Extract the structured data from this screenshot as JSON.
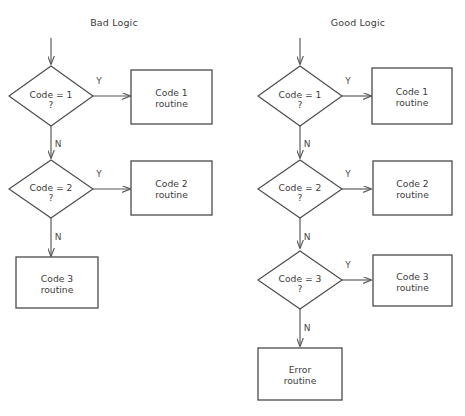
{
  "page": {
    "background": "#ffffff",
    "line_color": "#4a4a4a",
    "text_color": "#3c3c3c",
    "width": 465,
    "height": 416
  },
  "charts": [
    {
      "id": "bad-logic",
      "title": "Bad Logic",
      "title_x": 114,
      "title_y": 26,
      "entry_arrow": {
        "x": 51,
        "y1": 38,
        "y2": 64
      },
      "rows": [
        {
          "decision": {
            "name": "decision-code-1",
            "line1": "Code = 1",
            "line2": "?",
            "cx": 51,
            "cy": 96,
            "rx": 42,
            "ry": 30
          },
          "yes": {
            "label": "Y",
            "label_x": 99,
            "label_y": 84,
            "from_x": 93,
            "to_x": 130,
            "y": 96
          },
          "no": {
            "label": "N",
            "label_x": 58,
            "label_y": 147,
            "x": 51,
            "from_y": 126,
            "to_y": 158
          },
          "box": {
            "name": "box-code-1-routine",
            "line1": "Code 1",
            "line2": "routine",
            "x": 131,
            "y": 70,
            "w": 81,
            "h": 54
          }
        },
        {
          "decision": {
            "name": "decision-code-2",
            "line1": "Code = 2",
            "line2": "?",
            "cx": 51,
            "cy": 189,
            "rx": 42,
            "ry": 29
          },
          "yes": {
            "label": "Y",
            "label_x": 99,
            "label_y": 177,
            "from_x": 93,
            "to_x": 130,
            "y": 189
          },
          "no": {
            "label": "N",
            "label_x": 58,
            "label_y": 240,
            "x": 51,
            "from_y": 218,
            "to_y": 256
          },
          "box": {
            "name": "box-code-2-routine",
            "line1": "Code 2",
            "line2": "routine",
            "x": 131,
            "y": 161,
            "w": 81,
            "h": 54
          }
        }
      ],
      "terminal_box": {
        "name": "box-code-3-routine",
        "line1": "Code 3",
        "line2": "routine",
        "x": 16,
        "y": 257,
        "w": 82,
        "h": 51
      }
    },
    {
      "id": "good-logic",
      "title": "Good Logic",
      "title_x": 358,
      "title_y": 26,
      "entry_arrow": {
        "x": 300,
        "y1": 38,
        "y2": 64
      },
      "rows": [
        {
          "decision": {
            "name": "decision-code-1",
            "line1": "Code = 1",
            "line2": "?",
            "cx": 300,
            "cy": 96,
            "rx": 42,
            "ry": 30
          },
          "yes": {
            "label": "Y",
            "label_x": 348,
            "label_y": 84,
            "from_x": 342,
            "to_x": 371,
            "y": 96
          },
          "no": {
            "label": "N",
            "label_x": 307,
            "label_y": 147,
            "x": 300,
            "from_y": 126,
            "to_y": 158
          },
          "box": {
            "name": "box-code-1-routine",
            "line1": "Code 1",
            "line2": "routine",
            "x": 372,
            "y": 68,
            "w": 80,
            "h": 56
          }
        },
        {
          "decision": {
            "name": "decision-code-2",
            "line1": "Code = 2",
            "line2": "?",
            "cx": 300,
            "cy": 189,
            "rx": 42,
            "ry": 29
          },
          "yes": {
            "label": "Y",
            "label_x": 348,
            "label_y": 177,
            "from_x": 342,
            "to_x": 371,
            "y": 189
          },
          "no": {
            "label": "N",
            "label_x": 307,
            "label_y": 240,
            "x": 300,
            "from_y": 218,
            "to_y": 248
          },
          "box": {
            "name": "box-code-2-routine",
            "line1": "Code 2",
            "line2": "routine",
            "x": 373,
            "y": 161,
            "w": 79,
            "h": 54
          }
        },
        {
          "decision": {
            "name": "decision-code-3",
            "line1": "Code = 3",
            "line2": "?",
            "cx": 300,
            "cy": 280,
            "rx": 42,
            "ry": 29
          },
          "yes": {
            "label": "Y",
            "label_x": 348,
            "label_y": 268,
            "from_x": 342,
            "to_x": 371,
            "y": 280
          },
          "no": {
            "label": "N",
            "label_x": 307,
            "label_y": 331,
            "x": 300,
            "from_y": 309,
            "to_y": 346
          },
          "box": {
            "name": "box-code-3-routine",
            "line1": "Code 3",
            "line2": "routine",
            "x": 373,
            "y": 255,
            "w": 79,
            "h": 51
          }
        }
      ],
      "terminal_box": {
        "name": "box-error-routine",
        "line1": "Error",
        "line2": "routine",
        "x": 258,
        "y": 348,
        "w": 84,
        "h": 52
      }
    }
  ]
}
